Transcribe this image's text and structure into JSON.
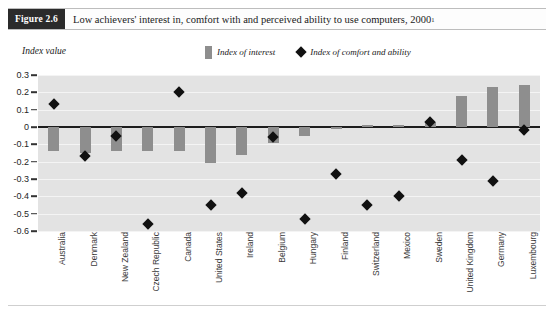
{
  "header": {
    "figure_tag": "Figure 2.6",
    "title": "Low achievers' interest in, comfort with and perceived ability to use computers, 2000",
    "title_footnote_marker": "1"
  },
  "legend": {
    "position": "top-center",
    "items": [
      {
        "marker": "bar-swatch",
        "label": "Index of interest",
        "color": "#8e8e8e"
      },
      {
        "marker": "diamond-swatch",
        "label": "Index of comfort and ability",
        "color": "#111111"
      }
    ]
  },
  "chart_data": {
    "type": "bar",
    "title": "Low achievers' interest in, comfort with and perceived ability to use computers, 2000",
    "xlabel": "",
    "ylabel": "Index value",
    "ylim": [
      -0.6,
      0.3
    ],
    "yticks": [
      0.3,
      0.2,
      0.1,
      0,
      -0.1,
      -0.2,
      -0.3,
      -0.4,
      -0.5,
      -0.6
    ],
    "ytick_labels": [
      "0.3",
      "0.2",
      "0.1",
      "0",
      "-0.1",
      "-0.2",
      "-0.3",
      "-0.4",
      "-0.5",
      "-0.6"
    ],
    "grid": true,
    "zero_line": true,
    "categories": [
      "Australia",
      "Denmark",
      "New Zealand",
      "Czech Republic",
      "Canada",
      "United States",
      "Ireland",
      "Belgium",
      "Hungary",
      "Finland",
      "Switzerland",
      "Mexico",
      "Sweden",
      "United Kingdom",
      "Germany",
      "Luxembourg"
    ],
    "series": [
      {
        "name": "Index of interest",
        "type": "bar",
        "color": "#8e8e8e",
        "values": [
          -0.14,
          -0.15,
          -0.14,
          -0.14,
          -0.14,
          -0.21,
          -0.16,
          -0.09,
          -0.05,
          -0.01,
          0.01,
          0.01,
          0.03,
          0.18,
          0.23,
          0.24
        ]
      },
      {
        "name": "Index of comfort and ability",
        "type": "scatter",
        "color": "#111111",
        "values": [
          0.13,
          -0.17,
          -0.05,
          -0.56,
          0.2,
          -0.45,
          -0.38,
          -0.06,
          -0.53,
          -0.27,
          -0.45,
          -0.4,
          0.03,
          -0.19,
          -0.31,
          -0.02
        ]
      }
    ]
  }
}
